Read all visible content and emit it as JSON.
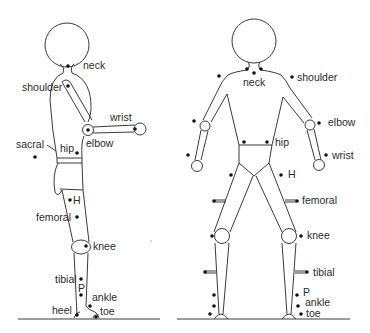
{
  "diagram": {
    "colors": {
      "line": "#3a3a3a",
      "marker": "#111111",
      "text": "#2a2a2a",
      "background": "#ffffff"
    },
    "side_view": {
      "labels": {
        "neck": "neck",
        "shoulder": "shoulder",
        "wrist": "wrist",
        "elbow": "elbow",
        "sacral": "sacral",
        "hip": "hip",
        "H": "H",
        "femoral": "femoral",
        "knee": "knee",
        "tibial": "tibial",
        "P": "P",
        "ankle": "ankle",
        "heel": "heel",
        "toe": "toe"
      }
    },
    "front_view": {
      "labels": {
        "neck": "neck",
        "shoulder": "shoulder",
        "elbow": "elbow",
        "hip": "hip",
        "wrist": "wrist",
        "H": "H",
        "femoral": "femoral",
        "knee": "knee",
        "tibial": "tibial",
        "P": "P",
        "ankle": "ankle",
        "toe": "toe"
      }
    }
  }
}
